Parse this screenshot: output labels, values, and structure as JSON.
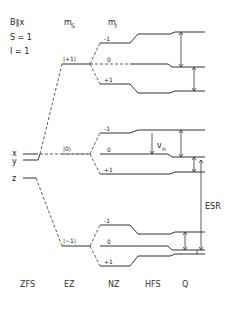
{
  "header": {
    "field": "B∥x",
    "spin_S": "S = 1",
    "spin_I": "I = 1",
    "ms_label": "m",
    "ms_sub": "S",
    "mi_label": "m",
    "mi_sub": "I"
  },
  "zfs_levels": {
    "x": "x",
    "y": "y",
    "z": "z"
  },
  "ez_states": {
    "plus": "|+1⟩",
    "zero": "|0⟩",
    "minus": "|−1⟩"
  },
  "mi_values": {
    "minus": "-1",
    "zero": "0",
    "plus": "+1"
  },
  "annotations": {
    "nuclear_freq": "ν",
    "nuclear_freq_sub": "n",
    "esr": "ESR"
  },
  "stage_labels": [
    "ZFS",
    "EZ",
    "NZ",
    "HFS",
    "Q"
  ],
  "colors": {
    "line": "#333333",
    "text": "#222222",
    "background": "#ffffff"
  }
}
